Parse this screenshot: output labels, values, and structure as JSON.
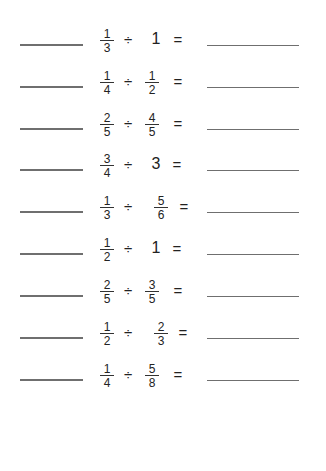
{
  "worksheet": {
    "problems": [
      {
        "a": {
          "num": "1",
          "den": "3"
        },
        "op": "÷",
        "b": {
          "whole": "1"
        },
        "eq": "=",
        "b_x": 156,
        "eq_x": 178
      },
      {
        "a": {
          "num": "1",
          "den": "4"
        },
        "op": "÷",
        "b": {
          "num": "1",
          "den": "2"
        },
        "eq": "=",
        "b_x": 152,
        "eq_x": 178
      },
      {
        "a": {
          "num": "2",
          "den": "5"
        },
        "op": "÷",
        "b": {
          "num": "4",
          "den": "5"
        },
        "eq": "=",
        "b_x": 152,
        "eq_x": 178
      },
      {
        "a": {
          "num": "3",
          "den": "4"
        },
        "op": "÷",
        "b": {
          "whole": "3"
        },
        "eq": "=",
        "b_x": 156,
        "eq_x": 177
      },
      {
        "a": {
          "num": "1",
          "den": "3"
        },
        "op": "÷",
        "b": {
          "num": "5",
          "den": "6"
        },
        "eq": "=",
        "b_x": 161,
        "eq_x": 184
      },
      {
        "a": {
          "num": "1",
          "den": "2"
        },
        "op": "÷",
        "b": {
          "whole": "1"
        },
        "eq": "=",
        "b_x": 156,
        "eq_x": 177
      },
      {
        "a": {
          "num": "2",
          "den": "5"
        },
        "op": "÷",
        "b": {
          "num": "3",
          "den": "5"
        },
        "eq": "=",
        "b_x": 152,
        "eq_x": 178
      },
      {
        "a": {
          "num": "1",
          "den": "2"
        },
        "op": "÷",
        "b": {
          "num": "2",
          "den": "3"
        },
        "eq": "=",
        "b_x": 161,
        "eq_x": 183
      },
      {
        "a": {
          "num": "1",
          "den": "4"
        },
        "op": "÷",
        "b": {
          "num": "5",
          "den": "8"
        },
        "eq": "=",
        "b_x": 152,
        "eq_x": 178
      }
    ],
    "answer_left_blank": "",
    "answer_right_blank": ""
  }
}
